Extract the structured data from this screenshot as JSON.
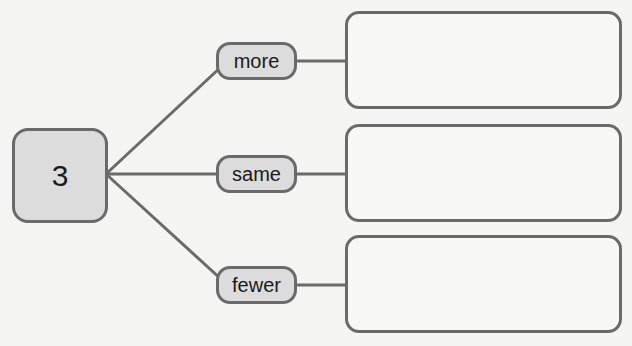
{
  "diagram": {
    "center": {
      "label": "3"
    },
    "branches": [
      {
        "label": "more",
        "answer": ""
      },
      {
        "label": "same",
        "answer": ""
      },
      {
        "label": "fewer",
        "answer": ""
      }
    ]
  },
  "colors": {
    "stroke": "#6a6a6a",
    "node_fill": "#dcdcdc",
    "background": "#f4f4f2"
  }
}
